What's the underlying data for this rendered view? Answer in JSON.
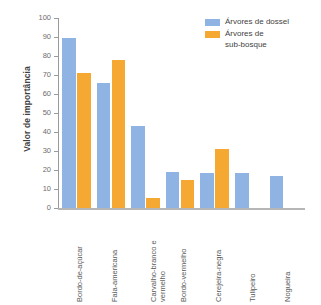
{
  "chart_data": {
    "type": "bar",
    "title": "",
    "xlabel": "",
    "ylabel": "Valor de importância",
    "ylim": [
      0,
      100
    ],
    "ytick_labels": [
      "100",
      "90",
      "80",
      "70",
      "60",
      "50",
      "40",
      "30",
      "20",
      "10",
      "0"
    ],
    "ytick_values": [
      100,
      90,
      80,
      70,
      60,
      50,
      40,
      30,
      20,
      10,
      0
    ],
    "grid": false,
    "legend_position": "top-right",
    "categories": [
      "Bordo-de-açúcar",
      "Faia-americana",
      "Carvalho-branco e\nvermelho",
      "Bordo-vermelho",
      "Cerejeira-negra",
      "Tulipeiro",
      "Nogueira"
    ],
    "series": [
      {
        "name": "Árvores de dossel",
        "color": "#8fb4e3",
        "values": [
          89.5,
          66,
          43,
          19,
          18.5,
          18.5,
          17
        ]
      },
      {
        "name": "Árvores de\nsub-bosque",
        "color": "#f5a832",
        "values": [
          71,
          78,
          5.5,
          14.5,
          31,
          0,
          0
        ]
      }
    ]
  },
  "legend": {
    "entries": [
      {
        "label": "Árvores de dossel",
        "color": "#8fb4e3"
      },
      {
        "label": "Árvores de\nsub-bosque",
        "color": "#f5a832"
      }
    ]
  },
  "colors": {
    "canopy_blue": "#8fb4e3",
    "understory_orange": "#f5a832",
    "axis": "#9a9a9a",
    "text": "#4d4d4d",
    "background": "#ffffff"
  }
}
